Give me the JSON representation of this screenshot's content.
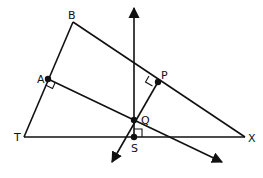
{
  "diagram": {
    "type": "geometry",
    "stroke_color": "#111111",
    "background": "#ffffff",
    "points": {
      "B": {
        "label": "B",
        "x": 73,
        "y": 22
      },
      "A": {
        "label": "A",
        "x": 48,
        "y": 79
      },
      "T": {
        "label": "T",
        "x": 24,
        "y": 137
      },
      "X": {
        "label": "X",
        "x": 245,
        "y": 137
      },
      "P": {
        "label": "P",
        "x": 158,
        "y": 82
      },
      "Q": {
        "label": "Q",
        "x": 134,
        "y": 120
      },
      "S": {
        "label": "S",
        "x": 134,
        "y": 137
      }
    },
    "segments": [
      "BT",
      "BX",
      "TX"
    ],
    "rays": [
      "SQ upward (perpendicular at S)",
      "PQ extended down-left",
      "AQ extended down-right"
    ],
    "right_angles": [
      "A",
      "P",
      "S"
    ],
    "labels": {
      "B": "B",
      "A": "A",
      "T": "T",
      "X": "X",
      "P": "P",
      "Q": "Q",
      "S": "S"
    }
  }
}
